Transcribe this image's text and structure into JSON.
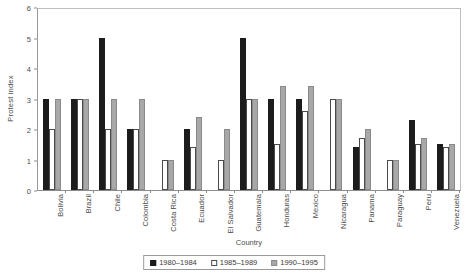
{
  "chart_data": {
    "type": "bar",
    "title": "",
    "xlabel": "Country",
    "ylabel": "Protest index",
    "ylim": [
      0,
      6
    ],
    "yticks": [
      0,
      1,
      2,
      3,
      4,
      5,
      6
    ],
    "grid": false,
    "legend_position": "bottom",
    "categories": [
      "Bolivia",
      "Brazil",
      "Chile",
      "Colombia",
      "Costa Rica",
      "Ecuador",
      "El Salvador",
      "Guatemala",
      "Honduras",
      "Mexico",
      "Nicaragua",
      "Panama",
      "Paraguay",
      "Peru",
      "Venezuela"
    ],
    "series": [
      {
        "name": "1980–1984",
        "color": "#1c1c1c",
        "values": [
          3,
          3,
          5,
          2,
          0,
          2,
          0,
          5,
          3,
          3,
          0,
          1.4,
          0,
          2.3,
          1.5
        ]
      },
      {
        "name": "1985–1989",
        "color": "#ffffff",
        "values": [
          2,
          3,
          2,
          2,
          1,
          1.4,
          1,
          3,
          1.5,
          2.6,
          3,
          1.7,
          1,
          1.5,
          1.4
        ]
      },
      {
        "name": "1990–1995",
        "color": "#a8a8a8",
        "values": [
          3,
          3,
          3,
          3,
          1,
          2.4,
          2,
          3,
          3.4,
          3.4,
          3,
          2,
          1,
          1.7,
          1.5
        ]
      }
    ]
  }
}
